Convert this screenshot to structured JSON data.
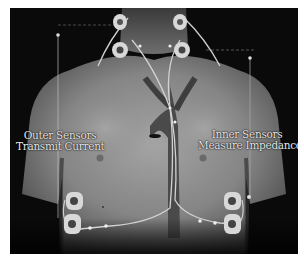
{
  "figure": {
    "labels": {
      "outer": {
        "line1": "Outer Sensors",
        "line2": "Transmit Current"
      },
      "inner": {
        "line1": "Inner Sensors",
        "line2": "Measure Impedance"
      }
    },
    "colors": {
      "background": "#0a0a0a",
      "skin": "#8a8a8a",
      "skin_light": "#a8a8a8",
      "aorta": "#4a4a4a",
      "electrode": "#d8d8d8",
      "wire": "#cfcfcf",
      "label_text": "#e8e8e8"
    },
    "electrodes": [
      {
        "position": "neck-left-outer"
      },
      {
        "position": "neck-left-inner"
      },
      {
        "position": "neck-right-outer"
      },
      {
        "position": "neck-right-inner"
      },
      {
        "position": "ribs-left-inner"
      },
      {
        "position": "ribs-left-outer"
      },
      {
        "position": "ribs-right-inner"
      },
      {
        "position": "ribs-right-outer"
      }
    ]
  }
}
